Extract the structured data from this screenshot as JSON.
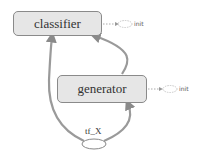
{
  "graph": {
    "nodes": [
      {
        "id": "classifier",
        "label": "classifier",
        "type": "namespace"
      },
      {
        "id": "generator",
        "label": "generator",
        "type": "namespace"
      },
      {
        "id": "tf_X",
        "label": "tf_X",
        "type": "placeholder"
      }
    ],
    "aux_nodes": [
      {
        "attached_to": "classifier",
        "label": "init"
      },
      {
        "attached_to": "generator",
        "label": "init"
      }
    ],
    "edges": [
      {
        "from": "tf_X",
        "to": "classifier"
      },
      {
        "from": "tf_X",
        "to": "generator"
      },
      {
        "from": "generator",
        "to": "classifier"
      }
    ]
  },
  "colors": {
    "node_fill": "#e6e6e6",
    "node_border": "#8a8a8a",
    "edge": "#9a9a9a",
    "dotted_edge": "#aaaaaa"
  }
}
